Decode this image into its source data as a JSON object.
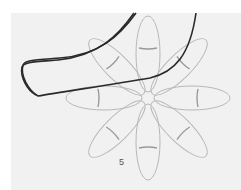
{
  "image": {
    "description": "Photo of dark wire laid over a pencil-drawn eight-petal flower template",
    "background_color": "#f1f1f1",
    "wire_color": "#2a2a2a",
    "drawing_color": "#b8b8b8",
    "petal_count": 8,
    "step_label": "5"
  }
}
